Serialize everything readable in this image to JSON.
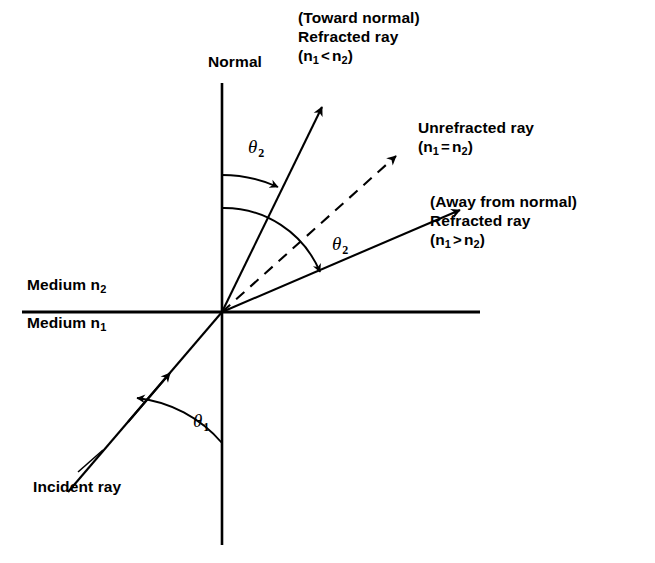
{
  "figure": {
    "type": "optics-ray-diagram",
    "background_color": "#ffffff",
    "line_color": "#000000"
  },
  "labels": {
    "normal": "Normal",
    "toward_normal": {
      "line1": "(Toward normal)",
      "line2": "Refracted ray",
      "cond_n": "n",
      "cond_sub1": "1",
      "cond_rel": "<",
      "cond_n2": "n",
      "cond_sub2": "2"
    },
    "unrefracted": {
      "line1": "Unrefracted ray",
      "cond_n": "n",
      "cond_sub1": "1",
      "cond_rel": "=",
      "cond_n2": "n",
      "cond_sub2": "2"
    },
    "away_from_normal": {
      "line1": "(Away from normal)",
      "line2": "Refracted ray",
      "cond_n": "n",
      "cond_sub1": "1",
      "cond_rel": ">",
      "cond_n2": "n",
      "cond_sub2": "2"
    },
    "medium_upper": {
      "text": "Medium n",
      "sub": "2"
    },
    "medium_lower": {
      "text": "Medium n",
      "sub": "1"
    },
    "incident_ray": "Incident ray",
    "theta2_upper": {
      "symbol": "θ",
      "sub": "2"
    },
    "theta2_lower": {
      "symbol": "θ",
      "sub": "2"
    },
    "theta1": {
      "symbol": "θ",
      "sub": "1"
    }
  },
  "geometry": {
    "origin": {
      "x": 222,
      "y": 312
    },
    "normal_line": {
      "x": 222,
      "y_top": 83,
      "y_bottom": 545
    },
    "interface_line": {
      "y": 312,
      "x_left": 22,
      "x_right": 480
    },
    "rays": [
      {
        "name": "refracted-toward-normal",
        "style": "solid",
        "tip_x": 327,
        "tip_y": 99,
        "angle_from_normal_deg": 26
      },
      {
        "name": "unrefracted",
        "style": "dashed",
        "tip_x": 402,
        "tip_y": 148,
        "angle_from_normal_deg": 48
      },
      {
        "name": "refracted-away-from-normal",
        "style": "solid",
        "tip_x": 466,
        "tip_y": 204,
        "angle_from_normal_deg": 64
      },
      {
        "name": "incident",
        "style": "solid",
        "tail_x": 68,
        "tail_y": 492,
        "angle_from_normal_deg": 48
      }
    ]
  }
}
